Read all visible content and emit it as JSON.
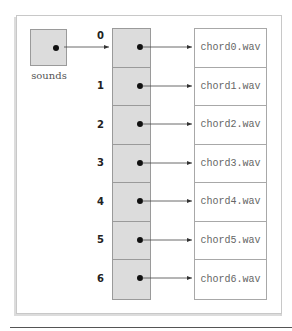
{
  "diagram": {
    "variable": {
      "name": "sounds",
      "fill": "#dcdcdc"
    },
    "array": {
      "fill": "#dcdcdc",
      "indices": [
        "0",
        "1",
        "2",
        "3",
        "4",
        "5",
        "6"
      ]
    },
    "files": [
      "chord0.wav",
      "chord1.wav",
      "chord2.wav",
      "chord3.wav",
      "chord4.wav",
      "chord5.wav",
      "chord6.wav"
    ]
  }
}
